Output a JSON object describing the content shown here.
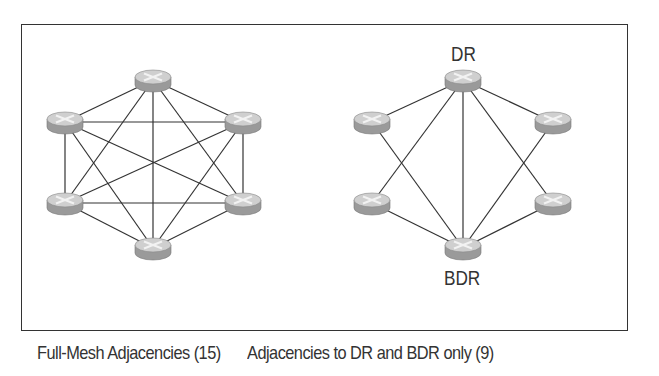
{
  "diagrams": [
    {
      "id": "full-mesh",
      "caption": "Full-Mesh Adjacencies (15)",
      "routers": [
        {
          "name": "r-top",
          "x": 153,
          "y": 80
        },
        {
          "name": "r-upper-left",
          "x": 65,
          "y": 122
        },
        {
          "name": "r-upper-right",
          "x": 243,
          "y": 122
        },
        {
          "name": "r-lower-left",
          "x": 65,
          "y": 203
        },
        {
          "name": "r-lower-right",
          "x": 243,
          "y": 203
        },
        {
          "name": "r-bottom",
          "x": 153,
          "y": 248
        }
      ],
      "links": [
        [
          0,
          1
        ],
        [
          0,
          2
        ],
        [
          0,
          3
        ],
        [
          0,
          4
        ],
        [
          0,
          5
        ],
        [
          1,
          2
        ],
        [
          1,
          3
        ],
        [
          1,
          4
        ],
        [
          1,
          5
        ],
        [
          2,
          3
        ],
        [
          2,
          4
        ],
        [
          2,
          5
        ],
        [
          3,
          4
        ],
        [
          3,
          5
        ],
        [
          4,
          5
        ]
      ]
    },
    {
      "id": "dr-bdr",
      "caption": "Adjacencies to DR and BDR only (9)",
      "labels": {
        "dr": "DR",
        "bdr": "BDR"
      },
      "routers": [
        {
          "name": "dr",
          "x": 463,
          "y": 80
        },
        {
          "name": "r-upper-left",
          "x": 372,
          "y": 122
        },
        {
          "name": "r-upper-right",
          "x": 553,
          "y": 122
        },
        {
          "name": "r-lower-left",
          "x": 372,
          "y": 203
        },
        {
          "name": "r-lower-right",
          "x": 553,
          "y": 203
        },
        {
          "name": "bdr",
          "x": 463,
          "y": 248
        }
      ],
      "links": [
        [
          0,
          1
        ],
        [
          0,
          2
        ],
        [
          0,
          3
        ],
        [
          0,
          4
        ],
        [
          0,
          5
        ],
        [
          5,
          1
        ],
        [
          5,
          2
        ],
        [
          5,
          3
        ],
        [
          5,
          4
        ]
      ]
    }
  ],
  "colors": {
    "line": "#333333",
    "router_top": "#cfcfcf",
    "router_side": "#9a9a9a",
    "router_mark": "#f2f2f2",
    "frame": "#333333"
  }
}
